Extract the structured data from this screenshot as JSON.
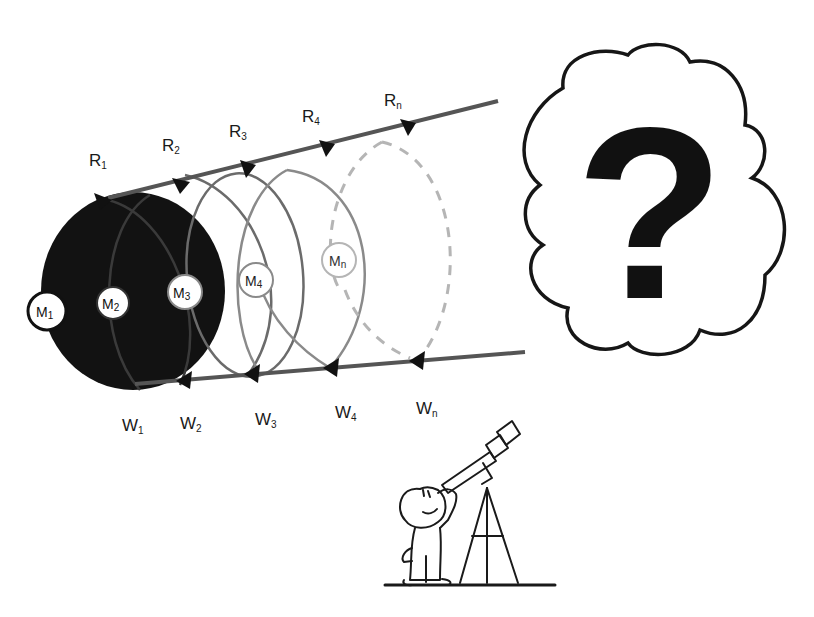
{
  "diagram": {
    "top_line_labels": [
      {
        "base": "R",
        "sub": "1"
      },
      {
        "base": "R",
        "sub": "2"
      },
      {
        "base": "R",
        "sub": "3"
      },
      {
        "base": "R",
        "sub": "4"
      },
      {
        "base": "R",
        "sub": "n"
      }
    ],
    "bottom_line_labels": [
      {
        "base": "W",
        "sub": "1"
      },
      {
        "base": "W",
        "sub": "2"
      },
      {
        "base": "W",
        "sub": "3"
      },
      {
        "base": "W",
        "sub": "4"
      },
      {
        "base": "W",
        "sub": "n"
      }
    ],
    "circle_markers": [
      {
        "base": "M",
        "sub": "1"
      },
      {
        "base": "M",
        "sub": "2"
      },
      {
        "base": "M",
        "sub": "3"
      },
      {
        "base": "M",
        "sub": "4"
      },
      {
        "base": "M",
        "sub": "n"
      }
    ],
    "cloud": {
      "symbol": "?"
    },
    "observer": {
      "label": "observer-with-telescope"
    },
    "colors": {
      "disk_fill": "#111111",
      "line": "#555555",
      "circle2": "#6e6e6e",
      "circle3": "#777777",
      "circle4": "#8c8c8c",
      "circle_n_dashed": "#b5b5b5",
      "arrow": "#111111",
      "ink": "#1a1a1a"
    }
  }
}
